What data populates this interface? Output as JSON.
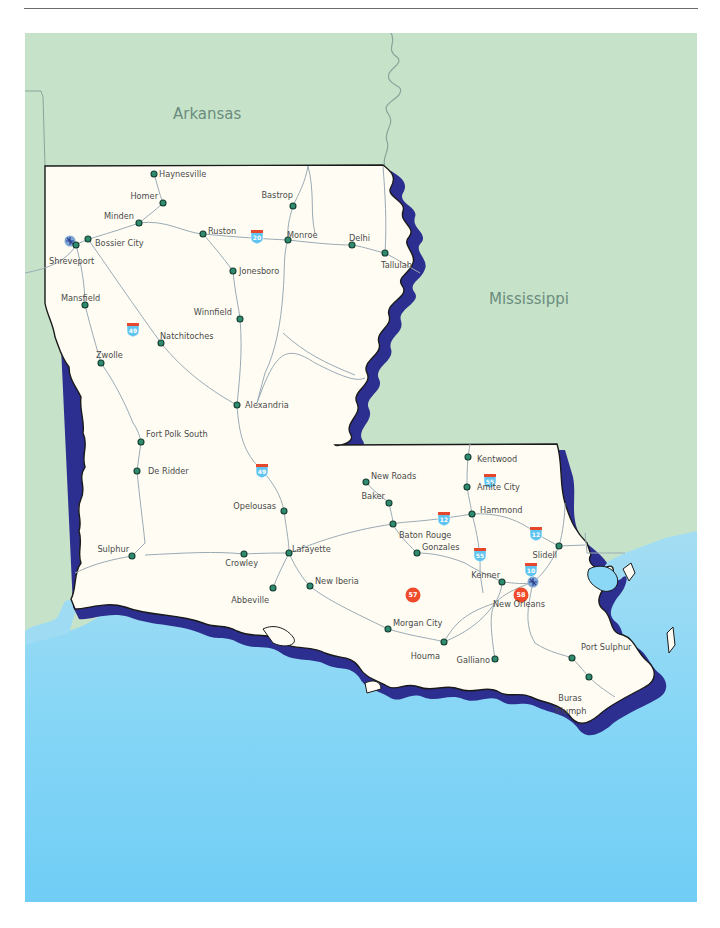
{
  "colors": {
    "neighbor_land": "#c6e3c9",
    "gulf_water_top": "#9fdcf4",
    "gulf_water_bottom": "#6fcdf5",
    "louisiana_land": "#fffdf3",
    "river_shadow": "#2c2f8f",
    "border": "#1a1a1a",
    "road": "#9aaab4",
    "city_dot": "#2e8b6e",
    "exit_marker": "#ef4a2a",
    "interstate_shield": "#5ec3ee"
  },
  "state_labels": [
    {
      "name": "Arkansas",
      "x": 148,
      "y": 86
    },
    {
      "name": "Mississippi",
      "x": 464,
      "y": 271
    }
  ],
  "cities": [
    {
      "name": "Haynesville",
      "dot": [
        129,
        141
      ],
      "label": [
        134,
        144
      ],
      "anchor": "start"
    },
    {
      "name": "Homer",
      "dot": [
        138,
        170
      ],
      "label": [
        133,
        166
      ],
      "anchor": "end"
    },
    {
      "name": "Minden",
      "dot": [
        114,
        190
      ],
      "label": [
        109,
        186
      ],
      "anchor": "end"
    },
    {
      "name": "Bossier City",
      "dot": [
        63,
        206
      ],
      "label": [
        70,
        213
      ],
      "anchor": "start"
    },
    {
      "name": "Shreveport",
      "dot": [
        51,
        212
      ],
      "label": [
        24,
        231
      ],
      "anchor": "start"
    },
    {
      "name": "Ruston",
      "dot": [
        178,
        201
      ],
      "label": [
        183,
        201
      ],
      "anchor": "start"
    },
    {
      "name": "Monroe",
      "dot": [
        263,
        207
      ],
      "label": [
        262,
        205
      ],
      "anchor": "start"
    },
    {
      "name": "Bastrop",
      "dot": [
        268,
        173
      ],
      "label": [
        268,
        165
      ],
      "anchor": "end"
    },
    {
      "name": "Delhi",
      "dot": [
        327,
        212
      ],
      "label": [
        324,
        208
      ],
      "anchor": "start"
    },
    {
      "name": "Tallulah",
      "dot": [
        360,
        220
      ],
      "label": [
        356,
        235
      ],
      "anchor": "start"
    },
    {
      "name": "Jonesboro",
      "dot": [
        208,
        238
      ],
      "label": [
        214,
        241
      ],
      "anchor": "start"
    },
    {
      "name": "Mansfield",
      "dot": [
        60,
        272
      ],
      "label": [
        36,
        268
      ],
      "anchor": "start"
    },
    {
      "name": "Winnfield",
      "dot": [
        215,
        286
      ],
      "label": [
        207,
        282
      ],
      "anchor": "end"
    },
    {
      "name": "Natchitoches",
      "dot": [
        136,
        310
      ],
      "label": [
        135,
        306
      ],
      "anchor": "start"
    },
    {
      "name": "Zwolle",
      "dot": [
        76,
        330
      ],
      "label": [
        71,
        325
      ],
      "anchor": "start"
    },
    {
      "name": "Alexandria",
      "dot": [
        212,
        372
      ],
      "label": [
        220,
        375
      ],
      "anchor": "start"
    },
    {
      "name": "Fort Polk South",
      "dot": [
        116,
        409
      ],
      "label": [
        121,
        404
      ],
      "anchor": "start"
    },
    {
      "name": "De Ridder",
      "dot": [
        112,
        438
      ],
      "label": [
        123,
        441
      ],
      "anchor": "start"
    },
    {
      "name": "Opelousas",
      "dot": [
        259,
        478
      ],
      "label": [
        251,
        476
      ],
      "anchor": "end"
    },
    {
      "name": "Sulphur",
      "dot": [
        107,
        523
      ],
      "label": [
        104,
        519
      ],
      "anchor": "end"
    },
    {
      "name": "Crowley",
      "dot": [
        219,
        521
      ],
      "label": [
        233,
        533
      ],
      "anchor": "end"
    },
    {
      "name": "Lafayette",
      "dot": [
        264,
        520
      ],
      "label": [
        267,
        519
      ],
      "anchor": "start"
    },
    {
      "name": "Abbeville",
      "dot": [
        248,
        555
      ],
      "label": [
        244,
        570
      ],
      "anchor": "end"
    },
    {
      "name": "New Iberia",
      "dot": [
        285,
        553
      ],
      "label": [
        290,
        551
      ],
      "anchor": "start"
    },
    {
      "name": "New Roads",
      "dot": [
        341,
        449
      ],
      "label": [
        346,
        446
      ],
      "anchor": "start"
    },
    {
      "name": "Baker",
      "dot": [
        364,
        470
      ],
      "label": [
        360,
        466
      ],
      "anchor": "end"
    },
    {
      "name": "Baton Rouge",
      "dot": [
        368,
        491
      ],
      "label": [
        374,
        505
      ],
      "anchor": "start"
    },
    {
      "name": "Gonzales",
      "dot": [
        392,
        520
      ],
      "label": [
        397,
        517
      ],
      "anchor": "start"
    },
    {
      "name": "Kentwood",
      "dot": [
        443,
        424
      ],
      "label": [
        452,
        429
      ],
      "anchor": "start"
    },
    {
      "name": "Amite City",
      "dot": [
        442,
        454
      ],
      "label": [
        452,
        457
      ],
      "anchor": "start"
    },
    {
      "name": "Hammond",
      "dot": [
        447,
        481
      ],
      "label": [
        455,
        480
      ],
      "anchor": "start"
    },
    {
      "name": "Slidell",
      "dot": [
        534,
        513
      ],
      "label": [
        532,
        525
      ],
      "anchor": "end"
    },
    {
      "name": "Kenner",
      "dot": [
        477,
        549
      ],
      "label": [
        475,
        545
      ],
      "anchor": "end"
    },
    {
      "name": "New Orleans",
      "dot": null,
      "label": [
        468,
        574
      ],
      "anchor": "start"
    },
    {
      "name": "Morgan City",
      "dot": [
        363,
        596
      ],
      "label": [
        368,
        593
      ],
      "anchor": "start"
    },
    {
      "name": "Houma",
      "dot": [
        419,
        609
      ],
      "label": [
        415,
        626
      ],
      "anchor": "end"
    },
    {
      "name": "Galliano",
      "dot": [
        470,
        626
      ],
      "label": [
        465,
        630
      ],
      "anchor": "end"
    },
    {
      "name": "Port Sulphur",
      "dot": [
        547,
        625
      ],
      "label": [
        556,
        617
      ],
      "anchor": "start"
    },
    {
      "name": "Buras",
      "dot": [
        564,
        644
      ],
      "label": [
        545,
        668
      ],
      "anchor": "middle"
    },
    {
      "name": "Triumph",
      "dot": null,
      "label": [
        545,
        681
      ],
      "anchor": "middle"
    }
  ],
  "airports": [
    {
      "name": "Shreveport airport",
      "x": 45,
      "y": 208
    },
    {
      "name": "New Orleans airport",
      "x": 508,
      "y": 549
    }
  ],
  "interstate_shields": [
    {
      "number": "20",
      "x": 232,
      "y": 203
    },
    {
      "number": "49",
      "x": 108,
      "y": 296
    },
    {
      "number": "49",
      "x": 237,
      "y": 437
    },
    {
      "number": "12",
      "x": 419,
      "y": 485
    },
    {
      "number": "12",
      "x": 511,
      "y": 500
    },
    {
      "number": "55",
      "x": 465,
      "y": 447
    },
    {
      "number": "55",
      "x": 455,
      "y": 521
    },
    {
      "number": "10",
      "x": 506,
      "y": 536
    }
  ],
  "exit_markers": [
    {
      "number": "57",
      "x": 388,
      "y": 562
    },
    {
      "number": "58",
      "x": 496,
      "y": 562
    }
  ]
}
